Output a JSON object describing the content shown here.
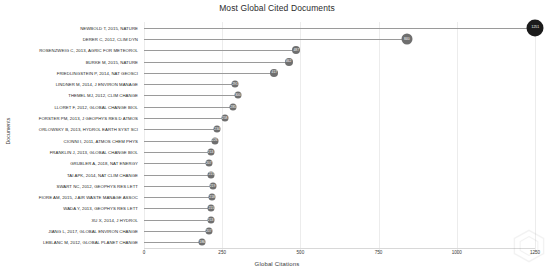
{
  "chart_data": {
    "type": "bar",
    "title": "Most Global Cited Documents",
    "xlabel": "Global Citations",
    "ylabel": "Documents",
    "xlim": [
      0,
      1250
    ],
    "xticks": [
      0,
      250,
      500,
      750,
      1000,
      1250
    ],
    "xtick_labels": [
      "0",
      "250",
      "500",
      "750",
      "1000",
      "1250"
    ],
    "grid": true,
    "legend": false,
    "orientation": "horizontal-lollipop",
    "categories": [
      "NEWBOLD T, 2015, NATURE",
      "DERER C, 2012, CLIM DYN",
      "ROSENZWEIG C, 2013, AGRIC FOR METEOROL",
      "BURKE M, 2015, NATURE",
      "FRIEDLINGSTEIN P, 2014, NAT GEOSCI",
      "LINDNER M, 2014, J ENVIRON MANAGE",
      "THEMEL MJ, 2012, CLIM CHANGE",
      "LLORET F, 2012, GLOBAL CHANGE BIOL",
      "FORSTER PM, 2013, J GEOPHYS RES D ATMOS",
      "ORLOWSKY B, 2013, HYDROL EARTH SYST SCI",
      "CIONNI I, 2011, ATMOS CHEM PHYS",
      "FRANKLIN J, 2013, GLOBAL CHANGE BIOL",
      "GRUBLER A, 2018, NAT ENERGY",
      "TAI APK, 2014, NAT CLIM CHANGE",
      "SWART NC, 2012, GEOPHYS RES LETT",
      "FIORE AM, 2015, J AIR WASTE MANAGE ASSOC",
      "WADA Y, 2013, GEOPHYS RES LETT",
      "XU X, 2014, J HYDROL",
      "JIANG L, 2017, GLOBAL ENVIRON CHANGE",
      "LEBLANC M, 2012, GLOBAL PLANET CHANGE"
    ],
    "values": [
      1251,
      840,
      487,
      462,
      417,
      291,
      300,
      285,
      258,
      234,
      226,
      213,
      207,
      215,
      219,
      218,
      215,
      213,
      207,
      186
    ],
    "marker_sizes": [
      17,
      11,
      8,
      8,
      8,
      7,
      7,
      7,
      7,
      7,
      7,
      7,
      7,
      7,
      7,
      7,
      7,
      7,
      7,
      7
    ],
    "colors": {
      "marker": "#6f6f6f",
      "marker_top": "#1b1b1b",
      "stem": "#9a9a9a",
      "grid": "#ececec",
      "text": "#262626"
    }
  }
}
